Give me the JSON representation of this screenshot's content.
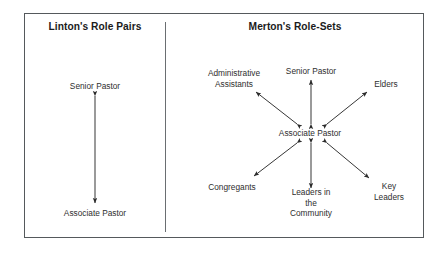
{
  "figure": {
    "panels": [
      {
        "id": "linton",
        "title": "Linton's Role Pairs",
        "nodes": {
          "top": "Senior Pastor",
          "bottom": "Associate Pastor"
        },
        "connections": [
          {
            "from": "Associate Pastor",
            "to": "Senior Pastor",
            "style": "double-headed-arrow"
          }
        ]
      },
      {
        "id": "merton",
        "title": "Merton's Role-Sets",
        "nodes": {
          "center": "Associate Pastor",
          "top": "Senior Pastor",
          "top_left": "Administrative\nAssistants",
          "top_right": "Elders",
          "bottom_left": "Congregants",
          "bottom_center": "Leaders in\nthe\nCommunity",
          "bottom_right": "Key\nLeaders"
        },
        "connections": [
          {
            "from": "Associate Pastor",
            "to": "Senior Pastor",
            "style": "double-headed-arrow"
          },
          {
            "from": "Associate Pastor",
            "to": "Administrative Assistants",
            "style": "double-headed-arrow"
          },
          {
            "from": "Associate Pastor",
            "to": "Elders",
            "style": "double-headed-arrow"
          },
          {
            "from": "Associate Pastor",
            "to": "Congregants",
            "style": "double-headed-arrow"
          },
          {
            "from": "Associate Pastor",
            "to": "Leaders in the Community",
            "style": "double-headed-arrow"
          },
          {
            "from": "Associate Pastor",
            "to": "Key Leaders",
            "style": "double-headed-arrow"
          }
        ]
      }
    ],
    "colors": {
      "background": "#ffffff",
      "border": "#55595c",
      "divider": "#6a6e71",
      "text": "#2e2e2e",
      "title_text": "#1b1b1b",
      "arrow": "#2b2b2b"
    }
  }
}
